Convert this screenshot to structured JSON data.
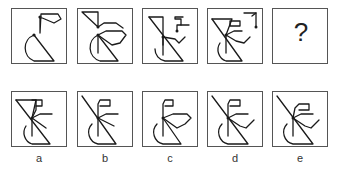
{
  "sequence": {
    "panels": [
      {
        "id": "seq-1",
        "content": "figure"
      },
      {
        "id": "seq-2",
        "content": "figure"
      },
      {
        "id": "seq-3",
        "content": "figure"
      },
      {
        "id": "seq-4",
        "content": "figure"
      },
      {
        "id": "seq-5",
        "content": "?"
      }
    ],
    "question_mark": "?"
  },
  "options": {
    "labels": [
      "a",
      "b",
      "c",
      "d",
      "e"
    ]
  }
}
